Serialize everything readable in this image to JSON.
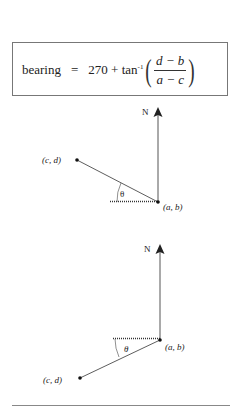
{
  "formula": {
    "lhs": "bearing",
    "equals": "=",
    "constant": "270 + tan",
    "exponent": "-1",
    "numerator": "d − b",
    "denominator": "a − c"
  },
  "diagram_top": {
    "north_label": "N",
    "origin_label": "(a, b)",
    "point_label": "(c, d)",
    "angle_label": "θ"
  },
  "diagram_bottom": {
    "north_label": "N",
    "origin_label": "(a, b)",
    "point_label": "(c, d)",
    "angle_label": "θ"
  },
  "colors": {
    "line": "#333333",
    "box_border": "#777777"
  }
}
